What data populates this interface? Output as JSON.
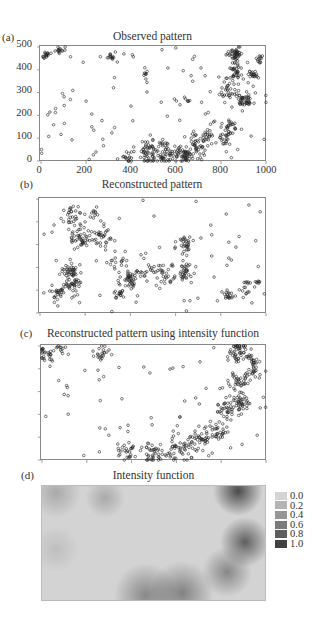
{
  "panels": [
    {
      "id": "a",
      "label": "(a)",
      "title": "Observed pattern",
      "frame": {
        "left": 39,
        "top": 45,
        "width": 227,
        "height": 116
      },
      "y_ticks": [
        "500",
        "400",
        "300",
        "200",
        "100",
        "0"
      ],
      "x_ticks": [
        "0",
        "200",
        "400",
        "600",
        "800",
        "1000"
      ],
      "seed": 11
    },
    {
      "id": "b",
      "label": "(b)",
      "title": "Reconstructed pattern",
      "frame": {
        "left": 38,
        "top": 197,
        "width": 228,
        "height": 116
      },
      "seed": 23
    },
    {
      "id": "c",
      "label": "(c)",
      "title": "Reconstructed pattern using intensity function",
      "frame": {
        "left": 40,
        "top": 344,
        "width": 226,
        "height": 116
      },
      "seed": 37
    },
    {
      "id": "d",
      "label": "(d)",
      "title": "Intensity function",
      "frame": {
        "left": 41,
        "top": 485,
        "width": 225,
        "height": 116
      }
    }
  ],
  "legend": {
    "items": [
      {
        "label": "0.0",
        "color": "#d4d4d4"
      },
      {
        "label": "0.2",
        "color": "#b4b4b4"
      },
      {
        "label": "0.4",
        "color": "#969696"
      },
      {
        "label": "0.6",
        "color": "#7a7a7a"
      },
      {
        "label": "0.8",
        "color": "#5e5e5e"
      },
      {
        "label": "1.0",
        "color": "#404040"
      }
    ]
  },
  "chart_data": [
    {
      "type": "scatter",
      "title": "Observed pattern",
      "panel": "(a)",
      "xlabel": "",
      "ylabel": "",
      "xlim": [
        0,
        1000
      ],
      "ylim": [
        0,
        500
      ],
      "x_ticks": [
        0,
        200,
        400,
        600,
        800,
        1000
      ],
      "y_ticks": [
        0,
        100,
        200,
        300,
        400,
        500
      ],
      "description": "Point pattern concentrated along an arc from bottom-center (x≈400–750, y≈0–100) curving up the right side (x≈800–950, y≈100–500), plus a cluster in the upper-left corner and sparse scattered points.",
      "clusters": [
        {
          "x": 20,
          "y": 465,
          "r": 15,
          "n": 14
        },
        {
          "x": 90,
          "y": 490,
          "r": 18,
          "n": 14
        },
        {
          "x": 310,
          "y": 460,
          "r": 15,
          "n": 12
        },
        {
          "x": 465,
          "y": 380,
          "r": 6,
          "n": 5
        },
        {
          "x": 650,
          "y": 265,
          "r": 8,
          "n": 5
        },
        {
          "x": 480,
          "y": 40,
          "r": 45,
          "n": 40
        },
        {
          "x": 570,
          "y": 35,
          "r": 50,
          "n": 45
        },
        {
          "x": 640,
          "y": 25,
          "r": 30,
          "n": 35
        },
        {
          "x": 700,
          "y": 70,
          "r": 40,
          "n": 35
        },
        {
          "x": 740,
          "y": 110,
          "r": 25,
          "n": 20
        },
        {
          "x": 810,
          "y": 90,
          "r": 30,
          "n": 20
        },
        {
          "x": 840,
          "y": 160,
          "r": 30,
          "n": 22
        },
        {
          "x": 830,
          "y": 300,
          "r": 30,
          "n": 25
        },
        {
          "x": 905,
          "y": 265,
          "r": 25,
          "n": 40
        },
        {
          "x": 870,
          "y": 380,
          "r": 35,
          "n": 30
        },
        {
          "x": 860,
          "y": 470,
          "r": 30,
          "n": 45
        },
        {
          "x": 940,
          "y": 380,
          "r": 20,
          "n": 18
        },
        {
          "x": 970,
          "y": 450,
          "r": 20,
          "n": 12
        },
        {
          "x": 380,
          "y": 20,
          "r": 25,
          "n": 15
        },
        {
          "x": 520,
          "y": 40,
          "r": 60,
          "n": 30
        }
      ],
      "sparse_points": 110
    },
    {
      "type": "scatter",
      "title": "Reconstructed pattern",
      "panel": "(b)",
      "xlim": [
        0,
        1000
      ],
      "ylim": [
        0,
        500
      ],
      "description": "Reconstructed clustered pattern; clusters spread across left and center of the window, a diagonal chain at the lower right.",
      "clusters": [
        {
          "x": 150,
          "y": 420,
          "r": 35,
          "n": 30
        },
        {
          "x": 170,
          "y": 330,
          "r": 40,
          "n": 40
        },
        {
          "x": 270,
          "y": 330,
          "r": 40,
          "n": 35
        },
        {
          "x": 240,
          "y": 440,
          "r": 20,
          "n": 10
        },
        {
          "x": 130,
          "y": 180,
          "r": 35,
          "n": 40
        },
        {
          "x": 150,
          "y": 120,
          "r": 30,
          "n": 30
        },
        {
          "x": 70,
          "y": 90,
          "r": 35,
          "n": 25
        },
        {
          "x": 400,
          "y": 150,
          "r": 45,
          "n": 50
        },
        {
          "x": 350,
          "y": 80,
          "r": 20,
          "n": 15
        },
        {
          "x": 540,
          "y": 180,
          "r": 50,
          "n": 40
        },
        {
          "x": 640,
          "y": 180,
          "r": 30,
          "n": 30
        },
        {
          "x": 640,
          "y": 300,
          "r": 35,
          "n": 30
        },
        {
          "x": 340,
          "y": 220,
          "r": 35,
          "n": 15
        },
        {
          "x": 830,
          "y": 80,
          "r": 25,
          "n": 18
        },
        {
          "x": 900,
          "y": 120,
          "r": 30,
          "n": 12
        },
        {
          "x": 960,
          "y": 130,
          "r": 15,
          "n": 8
        }
      ],
      "sparse_points": 60
    },
    {
      "type": "scatter",
      "title": "Reconstructed pattern using intensity function",
      "panel": "(c)",
      "xlim": [
        0,
        1000
      ],
      "ylim": [
        0,
        500
      ],
      "description": "Reconstruction follows the observed arc: dense along bottom center and right side, small clusters at upper left.",
      "clusters": [
        {
          "x": 20,
          "y": 460,
          "r": 25,
          "n": 25
        },
        {
          "x": 80,
          "y": 490,
          "r": 20,
          "n": 10
        },
        {
          "x": 270,
          "y": 470,
          "r": 30,
          "n": 20
        },
        {
          "x": 380,
          "y": 40,
          "r": 40,
          "n": 25
        },
        {
          "x": 490,
          "y": 30,
          "r": 45,
          "n": 35
        },
        {
          "x": 600,
          "y": 50,
          "r": 50,
          "n": 45
        },
        {
          "x": 700,
          "y": 90,
          "r": 40,
          "n": 35
        },
        {
          "x": 790,
          "y": 130,
          "r": 35,
          "n": 30
        },
        {
          "x": 830,
          "y": 230,
          "r": 40,
          "n": 35
        },
        {
          "x": 890,
          "y": 260,
          "r": 35,
          "n": 35
        },
        {
          "x": 870,
          "y": 340,
          "r": 35,
          "n": 30
        },
        {
          "x": 940,
          "y": 380,
          "r": 25,
          "n": 20
        },
        {
          "x": 880,
          "y": 480,
          "r": 40,
          "n": 50
        },
        {
          "x": 940,
          "y": 440,
          "r": 25,
          "n": 15
        }
      ],
      "sparse_points": 70
    },
    {
      "type": "heatmap",
      "title": "Intensity function",
      "panel": "(d)",
      "xlim": [
        0,
        1000
      ],
      "ylim": [
        0,
        500
      ],
      "colorbar": {
        "values": [
          0.0,
          0.2,
          0.4,
          0.6,
          0.8,
          1.0
        ]
      },
      "description": "Smoothed intensity: high (≈0.8–1.0) at upper-right corner and right side, moderately high (≈0.5–0.7) along bottom center, low elsewhere (≈0.0–0.2).",
      "hotspots": [
        {
          "x": 870,
          "y": 480,
          "r": 110,
          "v": 1.0
        },
        {
          "x": 900,
          "y": 260,
          "r": 110,
          "v": 0.85
        },
        {
          "x": 820,
          "y": 130,
          "r": 110,
          "v": 0.55
        },
        {
          "x": 620,
          "y": 40,
          "r": 140,
          "v": 0.6
        },
        {
          "x": 460,
          "y": 30,
          "r": 140,
          "v": 0.55
        },
        {
          "x": 60,
          "y": 470,
          "r": 110,
          "v": 0.3
        },
        {
          "x": 280,
          "y": 450,
          "r": 90,
          "v": 0.3
        },
        {
          "x": 60,
          "y": 230,
          "r": 100,
          "v": 0.15
        }
      ]
    }
  ]
}
